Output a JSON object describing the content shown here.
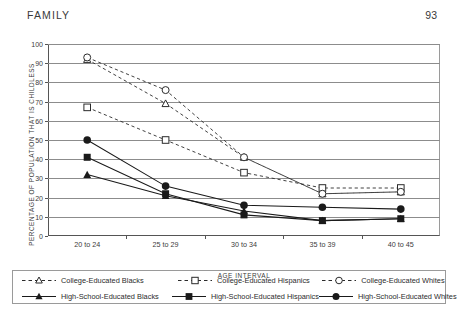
{
  "runhead": {
    "title": "FAMILY",
    "folio": "93"
  },
  "chart_data": {
    "type": "line",
    "title": "",
    "xlabel": "AGE INTERVAL",
    "ylabel": "PERCENTAGE OF POPULATION THAT IS CHILDLESS",
    "categories": [
      "20 to 24",
      "25 to 29",
      "30 to 34",
      "35 to 39",
      "40 to 45"
    ],
    "yticks": [
      0,
      10,
      20,
      30,
      40,
      50,
      60,
      70,
      80,
      90,
      100
    ],
    "ylim": [
      0,
      100
    ],
    "grid": true,
    "legend_position": "bottom",
    "series": [
      {
        "name": "College-Educated Blacks",
        "values": [
          92,
          69,
          41,
          22,
          23
        ],
        "line": "dashed",
        "marker": "triangle-open",
        "color": "#2b2b2b"
      },
      {
        "name": "College-Educated Hispanics",
        "values": [
          67,
          50,
          33,
          25,
          25
        ],
        "line": "dashed",
        "marker": "square-open",
        "color": "#2b2b2b"
      },
      {
        "name": "College-Educated Whites",
        "values": [
          93,
          76,
          41,
          22,
          23
        ],
        "line": "dashed",
        "marker": "circle-open",
        "color": "#2b2b2b"
      },
      {
        "name": "High-School-Educated Blacks",
        "values": [
          32,
          21,
          13,
          8,
          9
        ],
        "line": "solid",
        "marker": "triangle-filled",
        "color": "#1a1a1a"
      },
      {
        "name": "High-School-Educated Hispanics",
        "values": [
          41,
          22,
          11,
          8,
          9
        ],
        "line": "solid",
        "marker": "square-filled",
        "color": "#1a1a1a"
      },
      {
        "name": "High-School-Educated Whites",
        "values": [
          50,
          26,
          16,
          15,
          14
        ],
        "line": "solid",
        "marker": "circle-filled",
        "color": "#1a1a1a"
      }
    ]
  },
  "legend": {
    "items": [
      "College-Educated Blacks",
      "College-Educated Hispanics",
      "College-Educated Whites",
      "High-School-Educated Blacks",
      "High-School-Educated Hispanics",
      "High-School-Educated Whites"
    ]
  }
}
